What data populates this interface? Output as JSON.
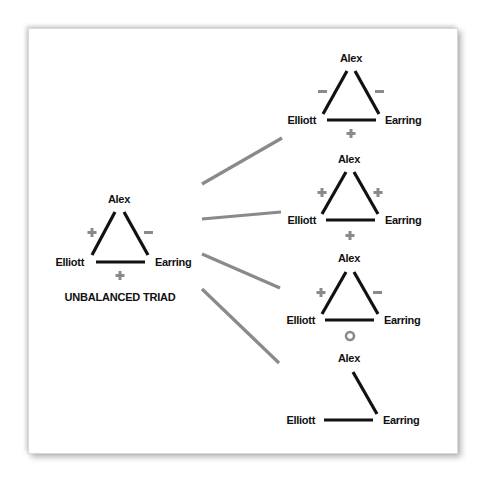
{
  "colors": {
    "edge": "#111111",
    "sign": "#8a8a8a",
    "connector": "#8a8a8a",
    "label": "#111111"
  },
  "main_triad": {
    "title": "UNBALANCED TRIAD",
    "nodes": {
      "top": "Alex",
      "left": "Elliott",
      "right": "Earring"
    },
    "signs": {
      "left_edge": "+",
      "right_edge": "−",
      "bottom_edge": "+"
    }
  },
  "outcomes": [
    {
      "nodes": {
        "top": "Alex",
        "left": "Elliott",
        "right": "Earring"
      },
      "signs": {
        "left_edge": "−",
        "right_edge": "−",
        "bottom_edge": "+"
      },
      "edges_present": [
        "left",
        "right",
        "bottom"
      ]
    },
    {
      "nodes": {
        "top": "Alex",
        "left": "Elliott",
        "right": "Earring"
      },
      "signs": {
        "left_edge": "+",
        "right_edge": "+",
        "bottom_edge": "+"
      },
      "edges_present": [
        "left",
        "right",
        "bottom"
      ]
    },
    {
      "nodes": {
        "top": "Alex",
        "left": "Elliott",
        "right": "Earring"
      },
      "signs": {
        "left_edge": "+",
        "right_edge": "−",
        "bottom_edge": "o"
      },
      "edges_present": [
        "left",
        "right",
        "bottom"
      ]
    },
    {
      "nodes": {
        "top": "Alex",
        "left": "Elliott",
        "right": "Earring"
      },
      "signs": {},
      "edges_present": [
        "right",
        "bottom"
      ]
    }
  ]
}
